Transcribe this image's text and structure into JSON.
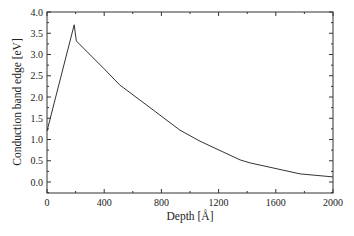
{
  "chart_data": {
    "type": "line",
    "title": "",
    "xlabel": "Depth [Å]",
    "ylabel": "Conduction band edge [eV]",
    "xlim": [
      0,
      2000
    ],
    "ylim": [
      -0.25,
      4.0
    ],
    "grid": false,
    "legend": null,
    "x_ticks": [
      0,
      400,
      800,
      1200,
      1600,
      2000
    ],
    "x_tick_labels": [
      "0",
      "400",
      "800",
      "1200",
      "1600",
      "2000"
    ],
    "y_ticks": [
      0.0,
      0.5,
      1.0,
      1.5,
      2.0,
      2.5,
      3.0,
      3.5,
      4.0
    ],
    "y_tick_labels": [
      "0.0",
      "0.5",
      "1.0",
      "1.5",
      "2.0",
      "2.5",
      "3.0",
      "3.5",
      "4.0"
    ],
    "series": [
      {
        "name": "Conduction band edge",
        "color": "#333333",
        "x": [
          0,
          190,
          205,
          400,
          510,
          650,
          930,
          1070,
          1350,
          1420,
          1770,
          2000
        ],
        "y": [
          1.2,
          3.7,
          3.32,
          2.66,
          2.28,
          1.93,
          1.22,
          0.96,
          0.52,
          0.45,
          0.19,
          0.12
        ]
      }
    ]
  }
}
